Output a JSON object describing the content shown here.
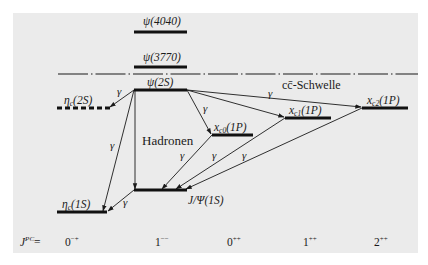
{
  "diagram": {
    "type": "energy-level-diagram",
    "threshold_label": "cc̄-Schwelle",
    "hadron_label": "Hadronen",
    "gamma_symbol": "γ",
    "jpc_label": "J",
    "jpc_sup": "PC",
    "jpc_eq": "=",
    "jpc_columns": [
      {
        "base": "0",
        "sup": "−+"
      },
      {
        "base": "1",
        "sup": "−−"
      },
      {
        "base": "0",
        "sup": "++"
      },
      {
        "base": "1",
        "sup": "++"
      },
      {
        "base": "2",
        "sup": "++"
      }
    ],
    "levels": [
      {
        "name": "ψ(4040)",
        "label": "ψ(4040)",
        "column": "1--",
        "style": "solid"
      },
      {
        "name": "ψ(3770)",
        "label": "ψ(3770)",
        "column": "1--",
        "style": "solid"
      },
      {
        "name": "ψ(2S)",
        "label": "ψ(2S)",
        "column": "1--",
        "style": "solid"
      },
      {
        "name": "ηc(2S)",
        "label_main": "η",
        "label_sub": "c",
        "label_tail": "(2S)",
        "column": "0-+",
        "style": "dashed"
      },
      {
        "name": "χc0(1P)",
        "label_main": "x",
        "label_sub": "c0",
        "label_tail": "(1P)",
        "column": "0++",
        "style": "solid"
      },
      {
        "name": "χc1(1P)",
        "label_main": "x",
        "label_sub": "c1",
        "label_tail": "(1P)",
        "column": "1++",
        "style": "solid"
      },
      {
        "name": "χc2(1P)",
        "label_main": "x",
        "label_sub": "c2",
        "label_tail": "(1P)",
        "column": "2++",
        "style": "solid"
      },
      {
        "name": "J/Ψ(1S)",
        "label": "J/Ψ(1S)",
        "column": "1--",
        "style": "solid"
      },
      {
        "name": "ηc(1S)",
        "label_main": "η",
        "label_sub": "c",
        "label_tail": "(1S)",
        "column": "0-+",
        "style": "solid"
      }
    ],
    "transitions": [
      {
        "from": "ψ(2S)",
        "to": "ηc(2S)",
        "label": "γ"
      },
      {
        "from": "ψ(2S)",
        "to": "ηc(1S)",
        "label": "γ"
      },
      {
        "from": "ψ(2S)",
        "to": "J/Ψ(1S)",
        "label": "Hadronen"
      },
      {
        "from": "ψ(2S)",
        "to": "χc0(1P)",
        "label": "γ"
      },
      {
        "from": "ψ(2S)",
        "to": "χc1(1P)",
        "label": ""
      },
      {
        "from": "ψ(2S)",
        "to": "χc2(1P)",
        "label": "γ"
      },
      {
        "from": "χc0(1P)",
        "to": "J/Ψ(1S)",
        "label": "γ"
      },
      {
        "from": "χc1(1P)",
        "to": "J/Ψ(1S)",
        "label": "γ"
      },
      {
        "from": "χc2(1P)",
        "to": "J/Ψ(1S)",
        "label": "γ"
      },
      {
        "from": "J/Ψ(1S)",
        "to": "ηc(1S)",
        "label": "γ"
      }
    ]
  }
}
